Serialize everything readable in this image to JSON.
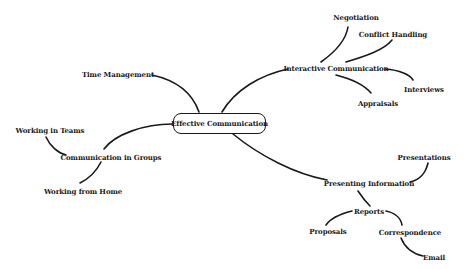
{
  "diagram": {
    "type": "mind-map",
    "root": {
      "label": "Effective Communication"
    },
    "branches": {
      "time_management": {
        "label": "Time Management"
      },
      "interactive_communication": {
        "label": "Interactive Communication",
        "children": {
          "negotiation": {
            "label": "Negotiation"
          },
          "conflict_handling": {
            "label": "Conflict Handling"
          },
          "interviews": {
            "label": "Interviews"
          },
          "appraisals": {
            "label": "Appraisals"
          }
        }
      },
      "communication_in_groups": {
        "label": "Communication in Groups",
        "children": {
          "working_in_teams": {
            "label": "Working in Teams"
          },
          "working_from_home": {
            "label": "Working from Home"
          }
        }
      },
      "presenting_information": {
        "label": "Presenting Information",
        "children": {
          "presentations": {
            "label": "Presentations"
          },
          "reports": {
            "label": "Reports",
            "children": {
              "proposals": {
                "label": "Proposals"
              },
              "correspondence": {
                "label": "Correspondence",
                "children": {
                  "email": {
                    "label": "Email"
                  }
                }
              }
            }
          }
        }
      }
    },
    "colors": {
      "line": "#1a1a1a",
      "text": "#1a1a1a",
      "background": "#ffffff"
    }
  }
}
